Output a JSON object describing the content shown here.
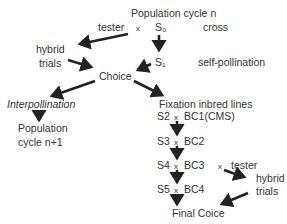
{
  "diagram": {
    "nodes": {
      "population_n": "Population cycle n",
      "tester_top": "tester",
      "cross_symbol_top": "x",
      "s0": "S₀",
      "cross_label": "cross",
      "hybrid_trials_left_1": "hybrid",
      "hybrid_trials_left_2": "trials",
      "s1": "S₁",
      "self_pollination": "self-pollination",
      "choice": "Choice",
      "interpollination": "Interpollination",
      "fixation": "Fixation inbred lines",
      "population_n1_1": "Population",
      "population_n1_2": "cycle n+1",
      "s2": "S2",
      "bc1": "BC1(CMS)",
      "s3": "S3",
      "bc2": "BC2",
      "s4": "S4",
      "bc3": "BC3",
      "cross_tester_x": "x",
      "tester_bottom": "tester",
      "s5": "S5",
      "bc4": "BC4",
      "hybrid_trials_right_1": "hybrid",
      "hybrid_trials_right_2": "trials",
      "final_choice": "Final Coice",
      "x_mark": "x"
    },
    "colors": {
      "text": "#333333",
      "arrow": "#222222",
      "background": "#ffffff"
    }
  }
}
